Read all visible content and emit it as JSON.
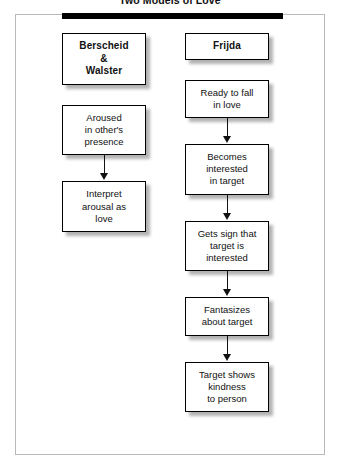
{
  "figure": {
    "title": "Two Models of Love",
    "accent_color": "#000000",
    "frame_color": "#b9b9bd",
    "background_color": "#ffffff"
  },
  "columns": [
    {
      "id": "berscheid-walster",
      "header": "Berscheid\n&\nWalster",
      "nodes": [
        {
          "text": "Aroused\nin other's\npresence"
        },
        {
          "text": "Interpret\narousal as\nlove"
        }
      ]
    },
    {
      "id": "frijda",
      "header": "Frijda",
      "nodes": [
        {
          "text": "Ready to fall\nin love"
        },
        {
          "text": "Becomes\ninterested\nin target"
        },
        {
          "text": "Gets sign that\ntarget is\ninterested"
        },
        {
          "text": "Fantasizes\nabout target"
        },
        {
          "text": "Target shows\nkindness\nto person"
        }
      ]
    }
  ]
}
